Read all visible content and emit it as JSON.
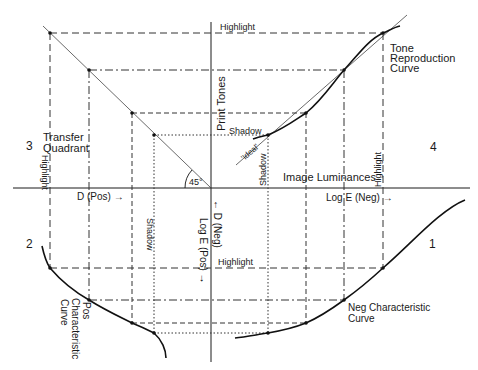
{
  "quadrant_numbers": {
    "q1": "1",
    "q2": "2",
    "q3": "3",
    "q4": "4"
  },
  "labels": {
    "highlight_top": "Highlight",
    "tone_reproduction": [
      "Tone",
      "Reproduction",
      "Curve"
    ],
    "print_tones": "Print Tones",
    "shadow_top": "Shadow",
    "ideal": "'Ideal'",
    "shadow_vertical_q4": "Shadow",
    "image_luminances": "Image Luminances",
    "highlight_vertical_q4": "Highlight",
    "transfer_quadrant": [
      "Transfer",
      "Quadrant"
    ],
    "highlight_vertical_q3": "Highlight",
    "angle": "45°",
    "d_pos": "D (Pos) →",
    "log_e_neg": "Log  E (Neg) →",
    "d_neg": "← D (Neg)",
    "log_e_pos": "Log E (Pos) →",
    "shadow_vertical_q2": "Shadow",
    "highlight_bottom": "Highlight",
    "pos_characteristic": [
      "Pos",
      "Characteristic",
      "Curve"
    ],
    "neg_characteristic": [
      "Neg Characteristic",
      "Curve"
    ]
  },
  "colors": {
    "line": "#1a1a1a",
    "guide": "#333333",
    "background": "#ffffff"
  }
}
